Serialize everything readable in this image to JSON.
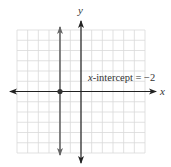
{
  "chart_data": {
    "type": "line",
    "title": "",
    "xlabel": "x",
    "ylabel": "y",
    "xlim": [
      -6,
      6
    ],
    "ylim": [
      -6,
      6
    ],
    "grid": true,
    "grid_step": 1,
    "series": [
      {
        "name": "x = -2",
        "kind": "vertical-line",
        "x": [
          -2,
          -2
        ],
        "y": [
          -6,
          6
        ],
        "color": "#555555",
        "arrows": "both"
      }
    ],
    "points": [
      {
        "x": -2,
        "y": 0,
        "label": "x-intercept"
      }
    ],
    "annotations": [
      {
        "text": "x-intercept = −2",
        "x": 0.6,
        "y": 1.3
      }
    ]
  },
  "labels": {
    "x_axis": "x",
    "y_axis": "y",
    "annotation_var": "x",
    "annotation_rest": "-intercept = −2"
  },
  "colors": {
    "grid": "#d9d9d9",
    "axis": "#222222",
    "line": "#666666",
    "point": "#333333"
  }
}
